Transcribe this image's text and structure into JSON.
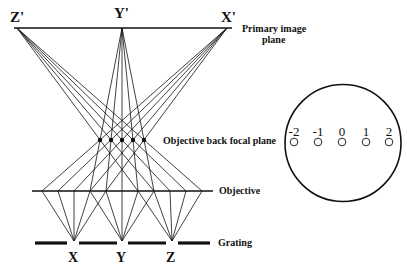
{
  "diagram": {
    "image_points": [
      {
        "label": "Z'",
        "x": 17
      },
      {
        "label": "Y'",
        "x": 122
      },
      {
        "label": "X'",
        "x": 227
      }
    ],
    "primary_image_plane_label_line1": "Primary image",
    "primary_image_plane_label_line2": "plane",
    "back_focal_plane_label": "Objective back focal plane",
    "objective_label": "Objective",
    "grating_label": "Grating",
    "object_points": [
      {
        "label": "X",
        "x": 74
      },
      {
        "label": "Y",
        "x": 122
      },
      {
        "label": "Z",
        "x": 172
      }
    ],
    "objective_hit_points": [
      42,
      58,
      74,
      90,
      106,
      122,
      138,
      154,
      170,
      186,
      202
    ],
    "focal_points_x": [
      100,
      111,
      122,
      133,
      144
    ],
    "diffraction_view": {
      "orders": [
        "-2",
        "-1",
        "0",
        "1",
        "2"
      ],
      "order_x": [
        294,
        318,
        342,
        366,
        388
      ]
    }
  }
}
